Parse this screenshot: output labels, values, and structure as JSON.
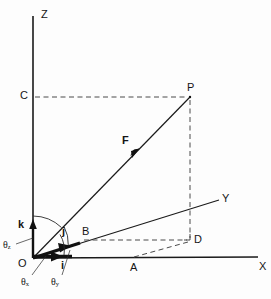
{
  "figure": {
    "type": "vector-diagram",
    "width": 271,
    "height": 299,
    "background_color": "#fdfdfd",
    "line_color": "#1a1a1a",
    "dashed_color": "#555555"
  },
  "axes": [
    {
      "name": "Z",
      "label": "Z",
      "from": [
        33,
        258
      ],
      "to": [
        33,
        16
      ],
      "style": "solid"
    },
    {
      "name": "X",
      "label": "X",
      "from": [
        33,
        258
      ],
      "to": [
        258,
        257
      ],
      "style": "solid"
    },
    {
      "name": "Y",
      "label": "Y",
      "from": [
        33,
        258
      ],
      "to": [
        219,
        200
      ],
      "style": "solid"
    }
  ],
  "axis_labels": {
    "z": "Z",
    "x": "X",
    "y": "Y"
  },
  "points": [
    {
      "name": "O",
      "label": "O",
      "x": 33,
      "y": 258,
      "label_x": 18,
      "label_y": 263
    },
    {
      "name": "P",
      "label": "P",
      "x": 190,
      "y": 97,
      "label_x": 188,
      "label_y": 84
    },
    {
      "name": "C",
      "label": "C",
      "x": 33,
      "y": 97,
      "label_x": 21,
      "label_y": 92
    },
    {
      "name": "D",
      "label": "D",
      "x": 190,
      "y": 240,
      "label_x": 195,
      "label_y": 236
    },
    {
      "name": "A",
      "label": "A",
      "x": 134,
      "y": 258,
      "label_x": 131,
      "label_y": 264
    },
    {
      "name": "B",
      "label": "B",
      "x": 80,
      "y": 241,
      "label_x": 83,
      "label_y": 228
    }
  ],
  "unit_vectors": [
    {
      "name": "k",
      "label": "k",
      "description": "unit vector along Z",
      "label_x": 19,
      "label_y": 222
    },
    {
      "name": "j",
      "label": "j",
      "description": "unit vector along Y",
      "label_x": 62,
      "label_y": 229
    },
    {
      "name": "i",
      "label": "i",
      "description": "unit vector along X",
      "label_x": 61,
      "label_y": 262
    }
  ],
  "force_vector": {
    "name": "F",
    "label": "F",
    "from": [
      33,
      258
    ],
    "to": [
      190,
      97
    ],
    "label_x": 124,
    "label_y": 139,
    "arrow_at": [
      136,
      153
    ]
  },
  "angles": [
    {
      "name": "theta_z",
      "symbol": "θ",
      "subscript": "z",
      "label_x": 3,
      "label_y": 242
    },
    {
      "name": "theta_x",
      "symbol": "θ",
      "subscript": "x",
      "label_x": 22,
      "label_y": 279
    },
    {
      "name": "theta_y",
      "symbol": "θ",
      "subscript": "y",
      "label_x": 52,
      "label_y": 279
    }
  ],
  "dashed_segments": [
    {
      "name": "C-to-P",
      "from": [
        35,
        97
      ],
      "to": [
        189,
        97
      ]
    },
    {
      "name": "P-to-D",
      "from": [
        190,
        99
      ],
      "to": [
        190,
        240
      ]
    },
    {
      "name": "B-to-D",
      "from": [
        82,
        240
      ],
      "to": [
        188,
        240
      ]
    },
    {
      "name": "A-to-D",
      "from": [
        134,
        257
      ],
      "to": [
        189,
        241
      ]
    }
  ]
}
